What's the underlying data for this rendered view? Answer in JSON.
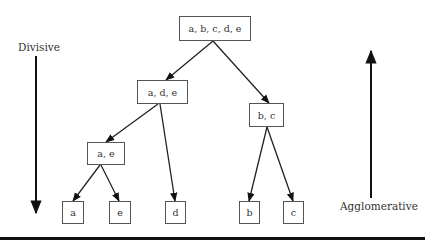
{
  "diagram": {
    "type": "hierarchical-clustering-tree",
    "labels": {
      "divisive": "Divisive",
      "agglomerative": "Agglomerative"
    },
    "nodes": [
      {
        "id": "root",
        "label": "a, b, c, d, e"
      },
      {
        "id": "ade",
        "label": "a, d, e"
      },
      {
        "id": "bc",
        "label": "b, c"
      },
      {
        "id": "ae",
        "label": "a, e"
      },
      {
        "id": "a",
        "label": "a"
      },
      {
        "id": "e",
        "label": "e"
      },
      {
        "id": "d",
        "label": "d"
      },
      {
        "id": "b",
        "label": "b"
      },
      {
        "id": "c",
        "label": "c"
      }
    ],
    "edges": [
      {
        "from": "root",
        "to": "ade"
      },
      {
        "from": "root",
        "to": "bc"
      },
      {
        "from": "ade",
        "to": "ae"
      },
      {
        "from": "ade",
        "to": "d"
      },
      {
        "from": "ae",
        "to": "a"
      },
      {
        "from": "ae",
        "to": "e"
      },
      {
        "from": "bc",
        "to": "b"
      },
      {
        "from": "bc",
        "to": "c"
      }
    ],
    "arrows": {
      "divisive_direction": "down",
      "agglomerative_direction": "up"
    }
  }
}
